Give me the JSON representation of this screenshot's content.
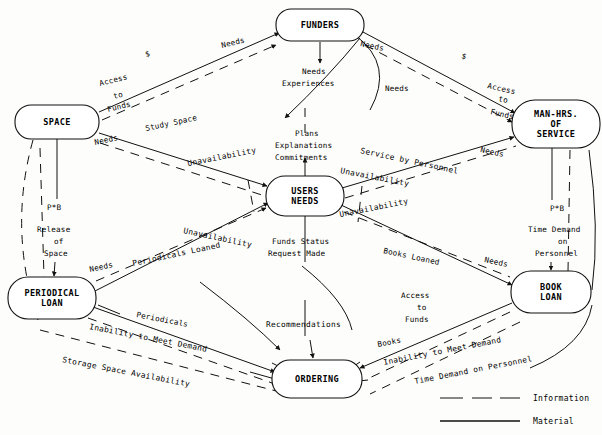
{
  "diagram": {
    "nodes": [
      {
        "id": "funders",
        "label_lines": [
          "FUNDERS"
        ],
        "cx": 320,
        "cy": 25,
        "rx": 44,
        "ry": 16
      },
      {
        "id": "space",
        "label_lines": [
          "SPACE"
        ],
        "cx": 57,
        "cy": 122,
        "rx": 42,
        "ry": 17
      },
      {
        "id": "manhrs",
        "label_lines": [
          "MAN-HRS.",
          "OF",
          "SERVICE"
        ],
        "cx": 556,
        "cy": 124,
        "rx": 44,
        "ry": 24
      },
      {
        "id": "users",
        "label_lines": [
          "USERS",
          "NEEDS"
        ],
        "cx": 305,
        "cy": 196,
        "rx": 39,
        "ry": 20
      },
      {
        "id": "periodical",
        "label_lines": [
          "PERIODICAL",
          "LOAN"
        ],
        "cx": 52,
        "cy": 298,
        "rx": 44,
        "ry": 21
      },
      {
        "id": "bookloan",
        "label_lines": [
          "BOOK",
          "LOAN"
        ],
        "cx": 551,
        "cy": 292,
        "rx": 40,
        "ry": 21
      },
      {
        "id": "ordering",
        "label_lines": [
          "ORDERING"
        ],
        "cx": 317,
        "cy": 379,
        "rx": 45,
        "ry": 19
      }
    ],
    "edge_labels": [
      {
        "id": "dollar-left",
        "text": "$",
        "x": 146,
        "y": 57,
        "rot": -17
      },
      {
        "id": "dollar-right",
        "text": "$",
        "x": 461,
        "y": 58,
        "rot": 17
      },
      {
        "id": "needs-funders-left",
        "text": "Needs",
        "x": 222,
        "y": 48,
        "rot": -14
      },
      {
        "id": "needs-funders-right",
        "text": "Needs",
        "x": 360,
        "y": 46,
        "rot": 12
      },
      {
        "id": "access-funds-left",
        "text": "Access",
        "x": 100,
        "y": 86,
        "rot": -14
      },
      {
        "id": "access-funds-left-2",
        "text": "to",
        "x": 114,
        "y": 99,
        "rot": -14
      },
      {
        "id": "access-funds-left-3",
        "text": "Funds",
        "x": 108,
        "y": 112,
        "rot": -14
      },
      {
        "id": "access-funds-right",
        "text": "Access",
        "x": 487,
        "y": 88,
        "rot": 13
      },
      {
        "id": "access-funds-right-2",
        "text": "to",
        "x": 498,
        "y": 101,
        "rot": 13
      },
      {
        "id": "access-funds-right-3",
        "text": "Funds",
        "x": 490,
        "y": 114,
        "rot": 13
      },
      {
        "id": "needs-experiences-1",
        "text": "Needs",
        "x": 302,
        "y": 74,
        "rot": 0
      },
      {
        "id": "needs-experiences-2",
        "text": "Experiences",
        "x": 282,
        "y": 86,
        "rot": 0
      },
      {
        "id": "needs-mid",
        "text": "Needs",
        "x": 385,
        "y": 91,
        "rot": 0
      },
      {
        "id": "needs-space",
        "text": "Needs",
        "x": 95,
        "y": 145,
        "rot": -12
      },
      {
        "id": "study-space",
        "text": "Study Space",
        "x": 146,
        "y": 131,
        "rot": -12
      },
      {
        "id": "plans",
        "text": "Plans",
        "x": 295,
        "y": 136,
        "rot": 0
      },
      {
        "id": "explanations",
        "text": "Explanations",
        "x": 275,
        "y": 148,
        "rot": 0
      },
      {
        "id": "commitments",
        "text": "Commitments",
        "x": 275,
        "y": 160,
        "rot": 0
      },
      {
        "id": "service-by-personnel",
        "text": "Service by Personnel",
        "x": 360,
        "y": 153,
        "rot": 12
      },
      {
        "id": "needs-manhrs",
        "text": "Needs",
        "x": 480,
        "y": 152,
        "rot": 12
      },
      {
        "id": "unavail-upper-left",
        "text": "Unavailability",
        "x": 188,
        "y": 166,
        "rot": -11
      },
      {
        "id": "unavail-upper-right",
        "text": "Unavailability",
        "x": 340,
        "y": 173,
        "rot": 11
      },
      {
        "id": "unavail-lower-left",
        "text": "Unavailability",
        "x": 183,
        "y": 233,
        "rot": 12
      },
      {
        "id": "unavail-lower-right",
        "text": "Unavailability",
        "x": 340,
        "y": 217,
        "rot": -11
      },
      {
        "id": "pb-left",
        "text": "P*B",
        "x": 47,
        "y": 210,
        "rot": 0
      },
      {
        "id": "release-of-space-1",
        "text": "Release",
        "x": 37,
        "y": 232,
        "rot": 0
      },
      {
        "id": "release-of-space-2",
        "text": "of",
        "x": 54,
        "y": 244,
        "rot": 0
      },
      {
        "id": "release-of-space-3",
        "text": "Space",
        "x": 44,
        "y": 256,
        "rot": 0
      },
      {
        "id": "pb-right",
        "text": "P*B",
        "x": 550,
        "y": 211,
        "rot": 0
      },
      {
        "id": "time-demand-1",
        "text": "Time Demand",
        "x": 528,
        "y": 232,
        "rot": 0
      },
      {
        "id": "time-demand-2",
        "text": "on",
        "x": 558,
        "y": 244,
        "rot": 0
      },
      {
        "id": "time-demand-3",
        "text": "Personnel",
        "x": 535,
        "y": 256,
        "rot": 0
      },
      {
        "id": "needs-periodical",
        "text": "Needs",
        "x": 90,
        "y": 272,
        "rot": -12
      },
      {
        "id": "periodicals-loaned",
        "text": "Periodicals Loaned",
        "x": 133,
        "y": 266,
        "rot": -12
      },
      {
        "id": "funds-status-1",
        "text": "Funds Status",
        "x": 272,
        "y": 244,
        "rot": 0
      },
      {
        "id": "funds-status-2",
        "text": "Request Made",
        "x": 268,
        "y": 256,
        "rot": 0
      },
      {
        "id": "books-loaned",
        "text": "Books Loaned",
        "x": 383,
        "y": 253,
        "rot": 12
      },
      {
        "id": "needs-bookloan",
        "text": "Needs",
        "x": 484,
        "y": 262,
        "rot": 12
      },
      {
        "id": "periodicals",
        "text": "Periodicals",
        "x": 136,
        "y": 317,
        "rot": 11
      },
      {
        "id": "inability-left",
        "text": "Inability to Meet Demand",
        "x": 89,
        "y": 329,
        "rot": 11
      },
      {
        "id": "storage-space",
        "text": "Storage Space Availability",
        "x": 62,
        "y": 362,
        "rot": 11
      },
      {
        "id": "recommendations",
        "text": "Recommendations",
        "x": 266,
        "y": 327,
        "rot": 0
      },
      {
        "id": "access-funds-bottom-1",
        "text": "Access",
        "x": 401,
        "y": 298,
        "rot": 0
      },
      {
        "id": "access-funds-bottom-2",
        "text": "to",
        "x": 417,
        "y": 310,
        "rot": 0
      },
      {
        "id": "access-funds-bottom-3",
        "text": "Funds",
        "x": 405,
        "y": 322,
        "rot": 0
      },
      {
        "id": "books",
        "text": "Books",
        "x": 378,
        "y": 347,
        "rot": -11
      },
      {
        "id": "inability-right",
        "text": "Inability to Meet Demand",
        "x": 384,
        "y": 365,
        "rot": -11
      },
      {
        "id": "time-demand-personnel",
        "text": "Time Demand on Personnel",
        "x": 415,
        "y": 384,
        "rot": -11
      }
    ],
    "legend": {
      "items": [
        {
          "id": "information",
          "label": "Information",
          "style": "dashed"
        },
        {
          "id": "material",
          "label": "Material",
          "style": "solid"
        }
      ]
    },
    "colors": {
      "stroke": "#111111",
      "background": "#fdfdfb",
      "node_fill": "#ffffff"
    }
  }
}
